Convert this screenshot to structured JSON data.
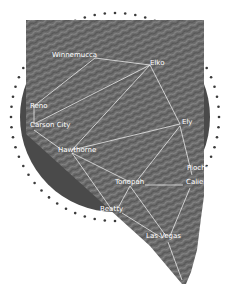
{
  "map": {
    "region": "Nevada",
    "colors": {
      "circle": "#4a4a4a",
      "dots": "#3a3a3a",
      "terrain": "#6e6e6e",
      "routes": "#e8e8e8",
      "labels": "#ffffff",
      "background": "#ffffff"
    },
    "cities": [
      {
        "name": "Winnemucca",
        "x": 52,
        "y": 57
      },
      {
        "name": "Elko",
        "x": 150,
        "y": 65
      },
      {
        "name": "Reno",
        "x": 30,
        "y": 108
      },
      {
        "name": "Carson City",
        "x": 30,
        "y": 127
      },
      {
        "name": "Ely",
        "x": 182,
        "y": 124
      },
      {
        "name": "Hawthorne",
        "x": 58,
        "y": 152
      },
      {
        "name": "Pioche",
        "x": 187,
        "y": 170
      },
      {
        "name": "Tonopah",
        "x": 115,
        "y": 184
      },
      {
        "name": "Caliente",
        "x": 186,
        "y": 184
      },
      {
        "name": "Beatty",
        "x": 100,
        "y": 211
      },
      {
        "name": "Las Vegas",
        "x": 146,
        "y": 238
      }
    ]
  }
}
